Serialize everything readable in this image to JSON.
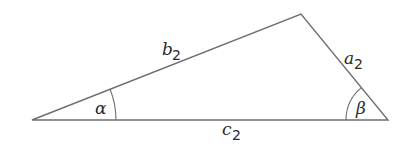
{
  "diagram": {
    "type": "triangle",
    "stroke_color": "#6e6e6e",
    "text_color": "#2a2a2a",
    "vertices": {
      "left": [
        32,
        120
      ],
      "top": [
        301,
        14
      ],
      "right": [
        388,
        120
      ]
    },
    "sides": {
      "b": {
        "base": "b",
        "sub": "2"
      },
      "a": {
        "base": "a",
        "sub": "2"
      },
      "c": {
        "base": "c",
        "sub": "2"
      }
    },
    "angles": {
      "alpha": {
        "symbol": "α",
        "vertex": "left"
      },
      "beta": {
        "symbol": "β",
        "vertex": "right"
      }
    }
  }
}
